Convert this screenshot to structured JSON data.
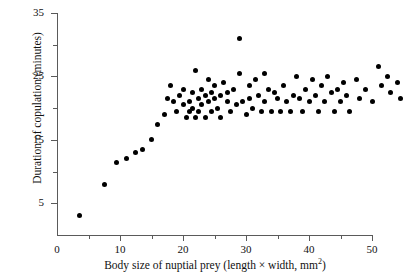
{
  "chart_data": {
    "type": "scatter",
    "title": "",
    "xlabel": "Body size of nuptial prey (length × width, mm²)",
    "ylabel": "Duration of copulation (minutes)",
    "xlabel_main": "Body size of nuptial prey (length × width, mm",
    "xlabel_sup": "2",
    "xlabel_tail": ")",
    "xlim": [
      0,
      55
    ],
    "ylim": [
      0,
      35
    ],
    "grid": false,
    "legend": null,
    "marker_color": "#000000",
    "axis_color": "#5a5a5a",
    "x_ticks_major": [
      10,
      20,
      30,
      40,
      50
    ],
    "x_ticks_minor": [
      5,
      15,
      25,
      35,
      45
    ],
    "x_tick_labels": [
      "10",
      "20",
      "30",
      "40",
      "50"
    ],
    "x_origin_label": "0",
    "y_ticks_major": [
      5,
      15,
      25,
      35
    ],
    "y_ticks_minor": [
      10,
      20,
      30
    ],
    "y_tick_labels": [
      "5",
      "15",
      "25",
      "35"
    ],
    "points": [
      [
        3.5,
        3.0
      ],
      [
        7.5,
        8.0
      ],
      [
        9.5,
        11.5
      ],
      [
        11.0,
        12.0
      ],
      [
        12.5,
        13.0
      ],
      [
        13.5,
        13.5
      ],
      [
        15.0,
        15.0
      ],
      [
        16.0,
        17.5
      ],
      [
        17.0,
        19.0
      ],
      [
        17.5,
        21.5
      ],
      [
        18.0,
        23.5
      ],
      [
        18.5,
        21.0
      ],
      [
        19.0,
        19.5
      ],
      [
        19.5,
        22.0
      ],
      [
        20.0,
        20.5
      ],
      [
        20.0,
        23.0
      ],
      [
        20.5,
        18.5
      ],
      [
        21.0,
        21.0
      ],
      [
        21.0,
        19.5
      ],
      [
        21.5,
        22.5
      ],
      [
        21.5,
        20.0
      ],
      [
        22.0,
        26.0
      ],
      [
        22.0,
        18.5
      ],
      [
        22.5,
        21.5
      ],
      [
        22.5,
        19.5
      ],
      [
        23.0,
        23.0
      ],
      [
        23.0,
        20.5
      ],
      [
        23.5,
        22.0
      ],
      [
        23.5,
        18.5
      ],
      [
        24.0,
        24.5
      ],
      [
        24.0,
        21.0
      ],
      [
        24.5,
        22.5
      ],
      [
        24.5,
        19.5
      ],
      [
        25.0,
        21.5
      ],
      [
        25.0,
        23.5
      ],
      [
        25.5,
        20.0
      ],
      [
        26.0,
        22.0
      ],
      [
        26.0,
        18.5
      ],
      [
        26.5,
        24.0
      ],
      [
        27.0,
        21.0
      ],
      [
        27.0,
        22.5
      ],
      [
        27.5,
        19.5
      ],
      [
        28.0,
        23.0
      ],
      [
        28.5,
        20.5
      ],
      [
        29.0,
        31.0
      ],
      [
        29.0,
        25.5
      ],
      [
        29.5,
        21.0
      ],
      [
        30.0,
        19.0
      ],
      [
        30.5,
        23.5
      ],
      [
        30.5,
        21.5
      ],
      [
        31.0,
        20.0
      ],
      [
        31.5,
        24.5
      ],
      [
        32.0,
        22.0
      ],
      [
        32.5,
        19.5
      ],
      [
        33.0,
        25.5
      ],
      [
        33.0,
        21.0
      ],
      [
        33.5,
        23.0
      ],
      [
        34.0,
        19.5
      ],
      [
        34.5,
        22.5
      ],
      [
        35.0,
        21.5
      ],
      [
        35.5,
        19.5
      ],
      [
        36.0,
        23.5
      ],
      [
        36.5,
        21.0
      ],
      [
        37.0,
        19.5
      ],
      [
        37.5,
        22.0
      ],
      [
        38.0,
        25.0
      ],
      [
        38.5,
        21.5
      ],
      [
        39.0,
        19.5
      ],
      [
        39.5,
        23.0
      ],
      [
        40.0,
        21.0
      ],
      [
        40.5,
        24.5
      ],
      [
        41.0,
        22.0
      ],
      [
        41.5,
        19.5
      ],
      [
        42.0,
        23.5
      ],
      [
        42.5,
        21.0
      ],
      [
        43.0,
        25.0
      ],
      [
        43.5,
        22.5
      ],
      [
        44.0,
        19.5
      ],
      [
        44.5,
        23.0
      ],
      [
        45.0,
        21.0
      ],
      [
        45.5,
        24.0
      ],
      [
        46.0,
        22.0
      ],
      [
        46.5,
        19.5
      ],
      [
        47.5,
        24.5
      ],
      [
        48.0,
        21.5
      ],
      [
        49.0,
        23.0
      ],
      [
        50.0,
        21.0
      ],
      [
        51.0,
        26.5
      ],
      [
        51.5,
        23.5
      ],
      [
        52.5,
        25.0
      ],
      [
        53.0,
        22.5
      ],
      [
        54.0,
        24.0
      ],
      [
        54.5,
        21.5
      ]
    ]
  }
}
